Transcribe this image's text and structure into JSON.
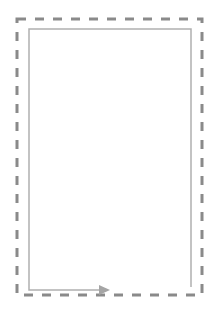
{
  "diagram": {
    "canvas": {
      "width": 217,
      "height": 321,
      "background": "#ffffff"
    },
    "outer_boundary": {
      "style": "dashed",
      "color": "#8a8a8a",
      "x": 17,
      "y": 19,
      "width": 185,
      "height": 276,
      "stroke_width": 3,
      "dash": [
        9,
        9
      ]
    },
    "inner_path": {
      "color": "#b0b0b0",
      "stroke_width": 1.5,
      "points": "191,287 191,29 29,29 29,290 100,290"
    },
    "arrow": {
      "color": "#a5a5a5",
      "tip_x": 110,
      "y": 290,
      "direction": "right"
    }
  }
}
